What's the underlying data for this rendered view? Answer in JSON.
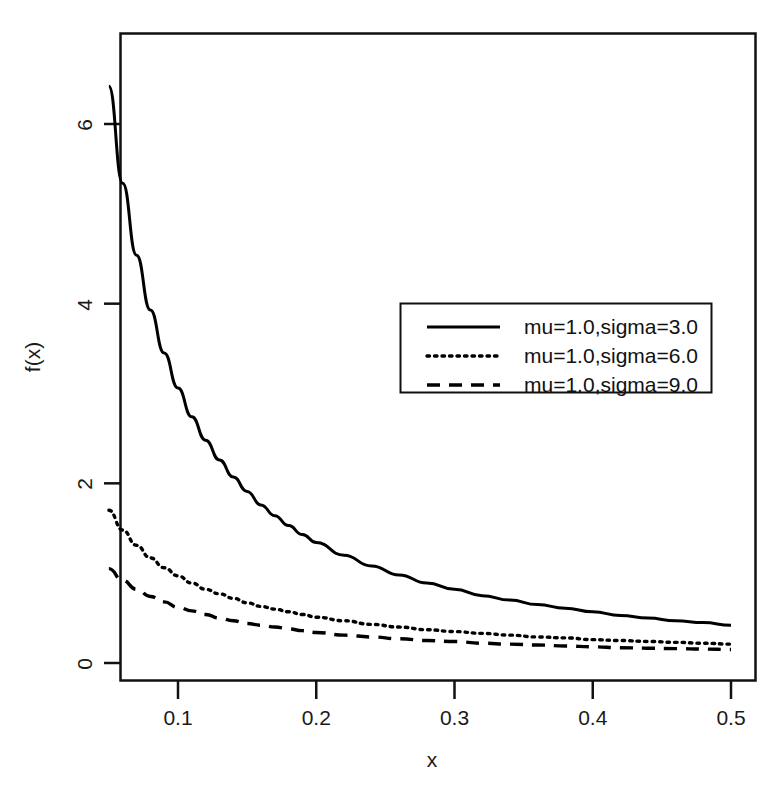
{
  "chart_data": {
    "type": "line",
    "title": "",
    "xlabel": "x",
    "ylabel": "f(x)",
    "xlim": [
      0.05,
      0.5
    ],
    "ylim": [
      -0.15,
      6.9
    ],
    "grid": false,
    "legend_position": "center-right",
    "xticks": [
      0.1,
      0.2,
      0.3,
      0.4,
      0.5
    ],
    "xtick_labels": [
      "0.1",
      "0.2",
      "0.3",
      "0.4",
      "0.5"
    ],
    "yticks": [
      0,
      2,
      4,
      6
    ],
    "ytick_labels": [
      "0",
      "2",
      "4",
      "6"
    ],
    "series": [
      {
        "name": "mu=1.0,sigma=3.0",
        "style": "solid",
        "color": "#000000",
        "x": [
          0.05,
          0.06,
          0.07,
          0.08,
          0.09,
          0.1,
          0.11,
          0.12,
          0.13,
          0.14,
          0.15,
          0.16,
          0.17,
          0.18,
          0.19,
          0.2,
          0.22,
          0.24,
          0.26,
          0.28,
          0.3,
          0.32,
          0.34,
          0.36,
          0.38,
          0.4,
          0.42,
          0.44,
          0.46,
          0.48,
          0.5
        ],
        "y": [
          6.42,
          5.34,
          4.54,
          3.93,
          3.45,
          3.06,
          2.74,
          2.48,
          2.26,
          2.07,
          1.91,
          1.76,
          1.64,
          1.53,
          1.43,
          1.34,
          1.2,
          1.08,
          0.98,
          0.89,
          0.82,
          0.75,
          0.7,
          0.65,
          0.61,
          0.57,
          0.53,
          0.5,
          0.47,
          0.45,
          0.42
        ]
      },
      {
        "name": "mu=1.0,sigma=6.0",
        "style": "dotted",
        "color": "#000000",
        "x": [
          0.05,
          0.06,
          0.07,
          0.08,
          0.09,
          0.1,
          0.11,
          0.12,
          0.13,
          0.14,
          0.15,
          0.16,
          0.17,
          0.18,
          0.19,
          0.2,
          0.22,
          0.24,
          0.26,
          0.28,
          0.3,
          0.32,
          0.34,
          0.36,
          0.38,
          0.4,
          0.42,
          0.44,
          0.46,
          0.48,
          0.5
        ],
        "y": [
          1.7,
          1.48,
          1.31,
          1.17,
          1.06,
          0.97,
          0.89,
          0.82,
          0.77,
          0.72,
          0.67,
          0.63,
          0.6,
          0.57,
          0.54,
          0.51,
          0.47,
          0.43,
          0.4,
          0.37,
          0.35,
          0.33,
          0.31,
          0.29,
          0.28,
          0.26,
          0.25,
          0.24,
          0.23,
          0.22,
          0.21
        ]
      },
      {
        "name": "mu=1.0,sigma=9.0",
        "style": "dashed",
        "color": "#000000",
        "x": [
          0.05,
          0.06,
          0.07,
          0.08,
          0.09,
          0.1,
          0.11,
          0.12,
          0.13,
          0.14,
          0.15,
          0.16,
          0.17,
          0.18,
          0.19,
          0.2,
          0.22,
          0.24,
          0.26,
          0.28,
          0.3,
          0.32,
          0.34,
          0.36,
          0.38,
          0.4,
          0.42,
          0.44,
          0.46,
          0.48,
          0.5
        ],
        "y": [
          1.05,
          0.92,
          0.82,
          0.74,
          0.68,
          0.62,
          0.58,
          0.54,
          0.5,
          0.47,
          0.44,
          0.42,
          0.4,
          0.38,
          0.36,
          0.34,
          0.31,
          0.29,
          0.27,
          0.25,
          0.24,
          0.22,
          0.21,
          0.2,
          0.19,
          0.18,
          0.17,
          0.165,
          0.16,
          0.155,
          0.15
        ]
      }
    ],
    "legend_entries": [
      {
        "label": "mu=1.0,sigma=3.0",
        "style": "solid"
      },
      {
        "label": "mu=1.0,sigma=6.0",
        "style": "dotted"
      },
      {
        "label": "mu=1.0,sigma=9.0",
        "style": "dashed"
      }
    ]
  }
}
